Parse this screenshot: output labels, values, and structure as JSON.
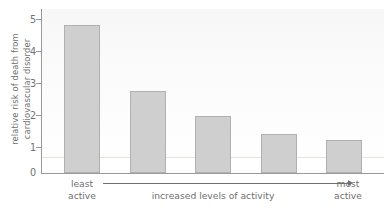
{
  "chart_data": {
    "type": "bar",
    "title": "",
    "xlabel": "increased levels of activity",
    "ylabel": "relative risk of death from\ncardiovascular disorder",
    "categories": [
      "least active",
      "2",
      "3",
      "4",
      "most active"
    ],
    "values": [
      4.5,
      2.5,
      1.75,
      1.2,
      1.0
    ],
    "ylim": [
      0,
      5
    ],
    "yticks": [
      0,
      1,
      2,
      3,
      4,
      5
    ],
    "ytick_labels": [
      "0",
      "1",
      "2",
      "3",
      "4",
      "5"
    ],
    "grid": false,
    "legend": null,
    "reference_line": 0.5,
    "axis_left_label": "least\nactive",
    "axis_right_label": "most\nactive",
    "bar_color": "#cfcfcf",
    "bar_border_color": "#b0b0b0",
    "axis_color": "#9a9a9a",
    "text_color": "#6f6f6f",
    "plot_background": "#f7f7f7"
  },
  "axis": {
    "y_title": "relative risk of death from\ncardiovascular disorder",
    "x_middle_label": "increased levels of activity",
    "x_left_label": "least\nactive",
    "x_right_label": "most\nactive"
  }
}
